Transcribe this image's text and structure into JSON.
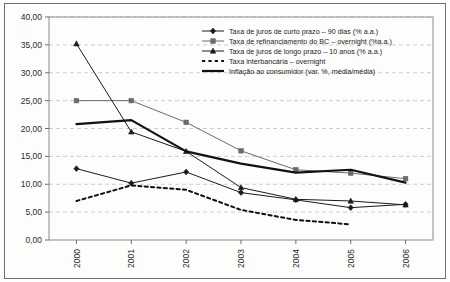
{
  "chart_data": {
    "type": "line",
    "title": "",
    "subtitle": "",
    "xlabel": "",
    "ylabel": "",
    "categories": [
      "2000",
      "2001",
      "2002",
      "2003",
      "2004",
      "2005",
      "2006"
    ],
    "x_tick_labels": [
      "2000",
      "2001",
      "2002",
      "2003",
      "2004",
      "2005",
      "2006"
    ],
    "y_tick_labels": [
      "0,00",
      "5,00",
      "10,00",
      "15,00",
      "20,00",
      "25,00",
      "30,00",
      "35,00",
      "40,00"
    ],
    "y_tick_values": [
      0,
      5,
      10,
      15,
      20,
      25,
      30,
      35,
      40
    ],
    "ylim": [
      0,
      40
    ],
    "grid": "horizontal-dashed",
    "legend_position": "top-center",
    "series": [
      {
        "name": "Taxa de juros de curto prazo – 90 dias (% a.a.)",
        "marker": "diamond",
        "style": "solid",
        "color": "#1a1a1a",
        "width": 1.0,
        "values": [
          12.8,
          10.2,
          12.2,
          8.5,
          7.2,
          5.8,
          6.4
        ]
      },
      {
        "name": "Taxa de refinanciamento do BC – overnight (%a.a.)",
        "marker": "square",
        "style": "solid",
        "color": "#6b6b6b",
        "width": 1.0,
        "values": [
          25.0,
          25.0,
          21.1,
          16.0,
          12.6,
          12.0,
          11.0
        ]
      },
      {
        "name": "Taxa de juros de longo prazo – 10 anos (% a.a.)",
        "marker": "triangle",
        "style": "solid",
        "color": "#1a1a1a",
        "width": 1.0,
        "values": [
          35.2,
          19.4,
          15.9,
          9.4,
          7.3,
          7.0,
          6.3
        ]
      },
      {
        "name": "Taxa interbancária – overnight",
        "marker": "none",
        "style": "dotted",
        "color": "#111111",
        "width": 2.0,
        "values": [
          7.0,
          9.8,
          9.0,
          5.4,
          3.6,
          2.8,
          null
        ]
      },
      {
        "name": "Inflação ao consumidor (var. %, média/média)",
        "marker": "none",
        "style": "solid",
        "color": "#111111",
        "width": 2.2,
        "values": [
          20.8,
          21.5,
          15.9,
          13.7,
          12.1,
          12.6,
          10.3
        ]
      }
    ]
  }
}
